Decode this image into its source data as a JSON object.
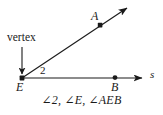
{
  "figure": {
    "type": "geometry-angle-diagram",
    "background_color": "#ffffff",
    "stroke_color": "#1a1a1a",
    "vertex_callout": {
      "label": "vertex",
      "points_to": "E"
    },
    "points": [
      {
        "name": "A",
        "label": "A",
        "x": 100,
        "y": 25,
        "label_x": 91,
        "label_y": 11
      },
      {
        "name": "B",
        "label": "B",
        "x": 115,
        "y": 77,
        "label_x": 111,
        "label_y": 81
      },
      {
        "name": "E",
        "label": "E",
        "x": 22,
        "y": 78,
        "label_x": 16,
        "label_y": 81
      }
    ],
    "rays": [
      {
        "name": "ray-EA",
        "from": "E",
        "through": "A",
        "arrow": true,
        "label": ""
      },
      {
        "name": "ray-EB",
        "from": "E",
        "through": "B",
        "arrow": true,
        "label": "s",
        "label_x": 150,
        "label_y": 69
      }
    ],
    "angle_number": {
      "label": "2",
      "x": 40,
      "y": 66
    },
    "caption": "∠2, ∠E, ∠AEB",
    "caption_parts": [
      "∠2",
      "∠E",
      "∠AEB"
    ]
  }
}
